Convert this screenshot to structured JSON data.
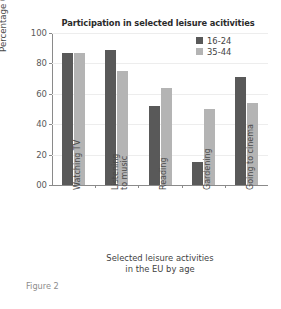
{
  "chart_data": {
    "type": "bar",
    "title": "Participation in selected leisure acitivities",
    "xlabel_line1": "Selected leisure activities",
    "xlabel_line2": "in the EU by age",
    "ylabel": "Percentage 0-100",
    "categories": [
      "Watching TV",
      "Listening to music",
      "Reading",
      "Gardening",
      "Going to cinema"
    ],
    "category_lines": [
      [
        "Watching TV"
      ],
      [
        "Listening",
        "to music"
      ],
      [
        "Reading"
      ],
      [
        "Gardening"
      ],
      [
        "Going to cinema"
      ]
    ],
    "series": [
      {
        "name": "16-24",
        "color": "#595959",
        "values": [
          87,
          89,
          52,
          15,
          71
        ]
      },
      {
        "name": "35-44",
        "color": "#b4b4b4",
        "values": [
          87,
          75,
          64,
          50,
          54
        ]
      }
    ],
    "ylim": [
      0,
      100
    ],
    "yticks": [
      0,
      20,
      40,
      60,
      80,
      100
    ],
    "ytick_labels": [
      "00",
      "20",
      "40",
      "60",
      "80",
      "100"
    ],
    "grid": true,
    "legend_position": "top-right"
  },
  "caption": "Figure 2"
}
